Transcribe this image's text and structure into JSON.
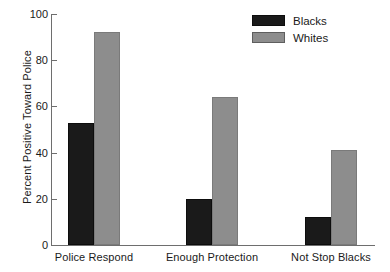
{
  "chart_data": {
    "type": "bar",
    "title": "",
    "subtitle": "",
    "xlabel": "",
    "ylabel": "Percent Positive Toward Police",
    "ylim": [
      0,
      100
    ],
    "ytick_labels": [
      "0",
      "20",
      "40",
      "60",
      "80",
      "100"
    ],
    "ytick_values": [
      0,
      20,
      40,
      60,
      80,
      100
    ],
    "grid": false,
    "legend_position": "top-right",
    "categories": [
      "Police Respond",
      "Enough Protection",
      "Not Stop Blacks"
    ],
    "series": [
      {
        "name": "Blacks",
        "color": "#1a1a1a",
        "values": [
          53,
          20,
          12
        ]
      },
      {
        "name": "Whites",
        "color": "#8d8d8d",
        "values": [
          92,
          64,
          41
        ]
      }
    ]
  },
  "legend": {
    "items": [
      {
        "label": "Blacks",
        "swatch": "legend-swatch-blacks"
      },
      {
        "label": "Whites",
        "swatch": "legend-swatch-whites"
      }
    ]
  },
  "colors": {
    "blacks": "#1a1a1a",
    "whites": "#8d8d8d",
    "axis": "#6e6e6e",
    "text": "#1a1a1a",
    "background": "#ffffff"
  }
}
